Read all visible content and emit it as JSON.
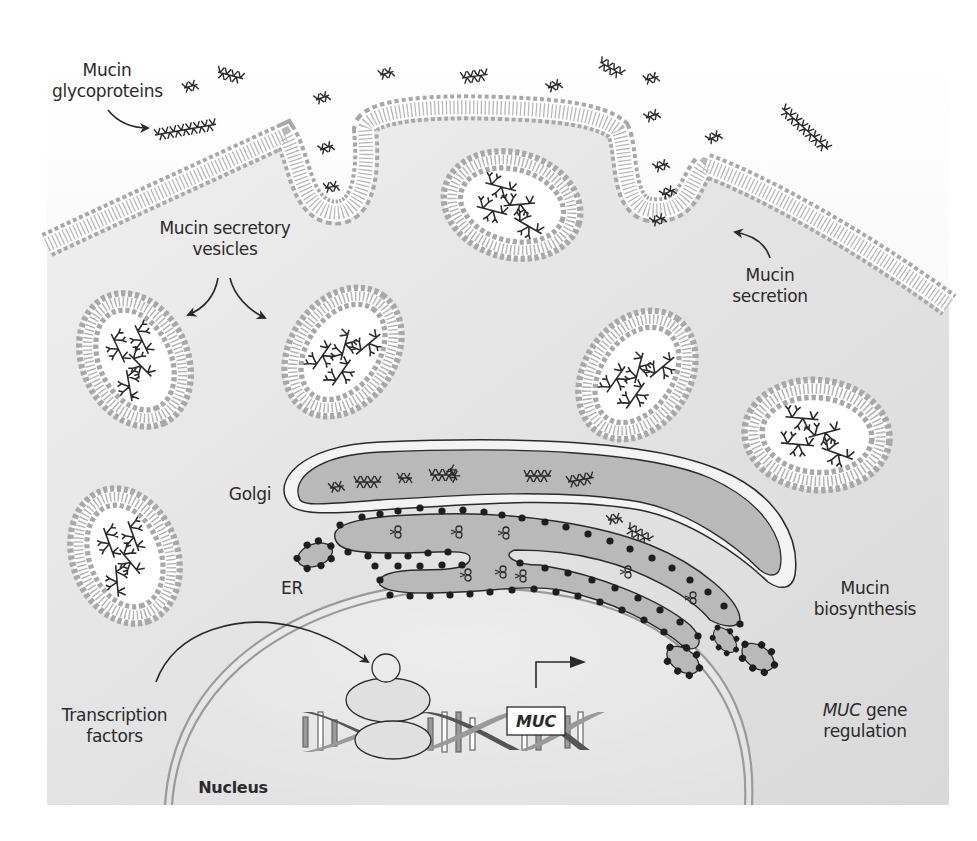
{
  "figure": {
    "type": "cell biology schematic",
    "colors": {
      "background": "#ffffff",
      "extracellular": "#f4f4f4",
      "cytoplasm": "#e2e2e2",
      "nucleoplasm": "#ebebeb",
      "membrane_head": "#a8a8a8",
      "organelle_fill": "#b9b9b9",
      "vesicle_lumen": "#ffffff",
      "line": "#2a2a2a",
      "nuclear_envelope": "#9a9a9a",
      "dna_strand_dark": "#555555",
      "dna_strand_light": "#9a9a9a"
    }
  },
  "labels": {
    "mucin_glycoproteins": [
      "Mucin",
      "glycoproteins"
    ],
    "secretory_vesicles": [
      "Mucin secretory",
      "vesicles"
    ],
    "mucin_secretion": [
      "Mucin",
      "secretion"
    ],
    "golgi": "Golgi",
    "er": "ER",
    "mucin_biosynthesis": [
      "Mucin",
      "biosynthesis"
    ],
    "muc_gene_regulation": {
      "italic": "MUC",
      "rest": " gene",
      "line2": "regulation"
    },
    "transcription_factors": [
      "Transcription",
      "factors"
    ],
    "nucleus": "Nucleus",
    "gene_box": "MUC"
  },
  "structures": {
    "plasma_membrane": "lipid bilayer with two invaginations (secretion sites)",
    "vesicles_count": 6,
    "extracellular_mucin_count": 14,
    "golgi_cisternae": 1,
    "er_tubules": 3,
    "er_small_vesicles": 3
  }
}
